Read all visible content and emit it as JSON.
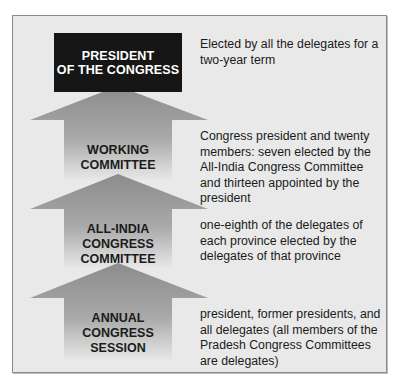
{
  "diagram": {
    "colors": {
      "background": "#e9e9e9",
      "top_box": "#161616",
      "arrow_top": "#8c8c8c",
      "arrow_bottom": "#ececec"
    },
    "levels": [
      {
        "title": "PRESIDENT OF THE CONGRESS",
        "title_lines": [
          "PRESIDENT",
          "OF THE CONGRESS"
        ],
        "description": "Elected by all the delegates for a two-year term"
      },
      {
        "title": "WORKING COMMITTEE",
        "title_lines": [
          "WORKING",
          "COMMITTEE"
        ],
        "description": "Congress president and twenty members: seven elected by the All-India Congress Committee and thirteen appointed by the president"
      },
      {
        "title": "ALL-INDIA CONGRESS COMMITTEE",
        "title_lines": [
          "ALL-INDIA",
          "CONGRESS",
          "COMMITTEE"
        ],
        "description": "one-eighth of the delegates of each province elected by the delegates of that province"
      },
      {
        "title": "ANNUAL CONGRESS SESSION",
        "title_lines": [
          "ANNUAL",
          "CONGRESS",
          "SESSION"
        ],
        "description": "president, former presidents, and all delegates (all members of the Pradesh Congress Committees are delegates)"
      }
    ]
  }
}
